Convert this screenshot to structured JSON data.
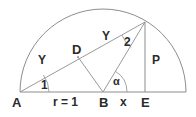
{
  "figure": {
    "type": "geometry-diagram",
    "stroke_color": "#7a7a7a",
    "text_color": "#2b2b2b",
    "background": "#ffffff"
  },
  "points": {
    "a": "A",
    "b": "B",
    "d": "D",
    "e": "E"
  },
  "segments": {
    "radius": "r = 1",
    "x": "x",
    "p": "P",
    "gamma_left": "Y",
    "gamma_right": "Y"
  },
  "angles": {
    "one": "1",
    "two": "2",
    "alpha": "α"
  },
  "geometry": {
    "baseline_y": 92,
    "point_a_x": 20,
    "point_b_x": 103,
    "point_e_x": 145,
    "circle_right_x": 186,
    "radius": 83,
    "apex_x": 145,
    "apex_y": 22,
    "point_d_x": 78,
    "point_d_y": 57
  }
}
